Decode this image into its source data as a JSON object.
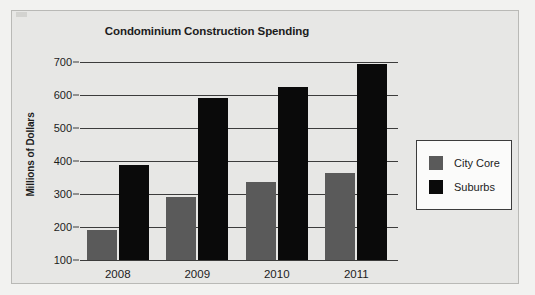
{
  "chart_data": {
    "type": "bar",
    "title": "Condominium Construction Spending",
    "xlabel": "",
    "ylabel": "Millions of Dollars",
    "categories": [
      "2008",
      "2009",
      "2010",
      "2011"
    ],
    "series": [
      {
        "name": "City Core",
        "color": "#5a5a5a",
        "values": [
          190,
          292,
          335,
          365
        ]
      },
      {
        "name": "Suburbs",
        "color": "#0a0a0a",
        "values": [
          387,
          590,
          625,
          695
        ]
      }
    ],
    "ylim": [
      100,
      700
    ],
    "yticks": [
      100,
      200,
      300,
      400,
      500,
      600,
      700
    ],
    "ytick_labels": [
      "100",
      "200",
      "300",
      "400",
      "500",
      "600",
      "700"
    ],
    "grid": true,
    "legend_position": "right",
    "legend_entries": [
      "City Core",
      "Suburbs"
    ],
    "background_color": "#e7e7e5",
    "axis_color": "#3c3c3c"
  }
}
